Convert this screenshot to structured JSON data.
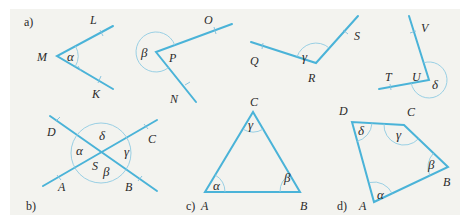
{
  "figure": {
    "background_color": "#f3f3ef",
    "line_color": "#4ab3d8",
    "arc_color": "#8fcbe2",
    "parts": {
      "a": {
        "label": "a)",
        "angles": [
          {
            "vertex": "M",
            "ray1": "L",
            "ray2": "K",
            "angle": "α"
          },
          {
            "vertex": "P",
            "ray1": "O",
            "ray2": "N",
            "angle": "β"
          },
          {
            "vertex": "R",
            "ray1": "Q",
            "ray2": "S",
            "angle": "γ"
          },
          {
            "vertex": "U",
            "ray1": "T",
            "ray2": "V",
            "angle": "δ"
          }
        ]
      },
      "b": {
        "label": "b)",
        "center": "S",
        "points": [
          "D",
          "C",
          "A",
          "B"
        ],
        "angles": {
          "alpha": "α",
          "beta": "β",
          "gamma": "γ",
          "delta": "δ"
        }
      },
      "c": {
        "label": "c)",
        "vertices": [
          "A",
          "B",
          "C"
        ],
        "angles": {
          "alpha": "α",
          "beta": "β",
          "gamma": "γ"
        }
      },
      "d": {
        "label": "d)",
        "vertices": [
          "A",
          "B",
          "C",
          "D"
        ],
        "angles": {
          "alpha": "α",
          "beta": "β",
          "gamma": "γ",
          "delta": "δ"
        }
      }
    }
  }
}
